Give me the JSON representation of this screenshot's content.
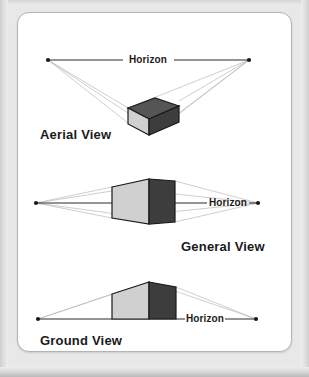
{
  "page": {
    "background_color": "#e8e8e8",
    "card_color": "#ffffff",
    "card_border_color": "#b4b4b4"
  },
  "colors": {
    "ink": "#1a1a1a",
    "horizon_line": "#2b2b2b",
    "ray_line": "#b9b9b9",
    "face_top": "#555555",
    "face_left_light": "#d0d0d0",
    "face_right_dark": "#3d3d3d",
    "face_front_light": "#c9c9c9"
  },
  "diagram": {
    "title_semantic": "three-point-perspective-viewpoints",
    "views": [
      {
        "id": "aerial",
        "label": "Aerial View",
        "horizon_label": "Horizon",
        "description": "Box seen from above the horizon line; top face visible.",
        "horizon_y": 47,
        "vanishing_points": [
          {
            "side": "left",
            "x": 30,
            "y": 47
          },
          {
            "side": "right",
            "x": 231,
            "y": 47
          }
        ],
        "box": {
          "top_face_color": "#555555",
          "left_face_color": "#d0d0d0",
          "right_face_color": "#3d3d3d"
        }
      },
      {
        "id": "general",
        "label": "General View",
        "horizon_label": "Horizon",
        "description": "Box seen at eye level; horizon passes through the box, neither top nor bottom visible.",
        "horizon_y": 44,
        "vanishing_points": [
          {
            "side": "left",
            "x": 18,
            "y": 44
          },
          {
            "side": "right",
            "x": 240,
            "y": 44
          }
        ],
        "box": {
          "left_face_color": "#d0d0d0",
          "right_face_color": "#3d3d3d"
        }
      },
      {
        "id": "ground",
        "label": "Ground View",
        "horizon_label": "Horizon",
        "description": "Box seen from below the horizon line; bottom edge sits on the horizon.",
        "horizon_y": 50,
        "vanishing_points": [
          {
            "side": "left",
            "x": 20,
            "y": 50
          },
          {
            "side": "right",
            "x": 238,
            "y": 50
          }
        ],
        "box": {
          "left_face_color": "#d0d0d0",
          "right_face_color": "#3d3d3d"
        }
      }
    ]
  }
}
